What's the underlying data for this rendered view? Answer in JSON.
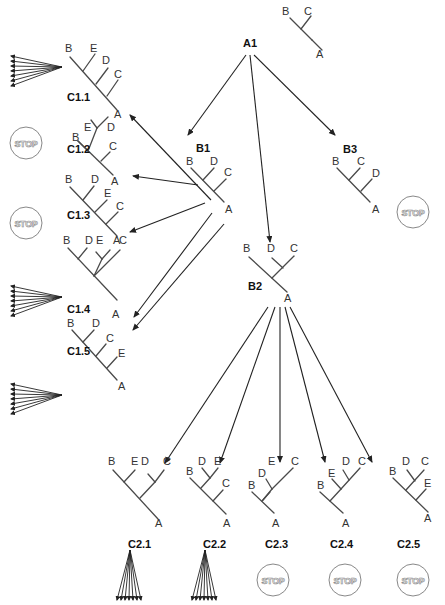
{
  "diagram": {
    "stop_label": "STOP",
    "colors": {
      "edge": "#4a4a4a",
      "arrow": "#222222",
      "stop_circle": "#888888",
      "text": "#333333"
    },
    "trees": [
      {
        "id": "A0",
        "name": "",
        "name_pos": [
          0,
          0
        ],
        "edges": [
          [
            290,
            18,
            312,
            40
          ],
          [
            301,
            29,
            311,
            16
          ],
          [
            312,
            40,
            322,
            50
          ]
        ],
        "leaves": [
          {
            "t": "B",
            "x": 282,
            "y": 15
          },
          {
            "t": "C",
            "x": 304,
            "y": 15
          },
          {
            "t": "A",
            "x": 316,
            "y": 58
          }
        ]
      },
      {
        "id": "A1",
        "name": "A1",
        "name_pos": [
          243,
          47
        ],
        "edges": [],
        "leaves": []
      },
      {
        "id": "C1.1",
        "name": "C1.1",
        "name_pos": [
          67,
          101
        ],
        "edges": [
          [
            70,
            57,
            117,
            110
          ],
          [
            83,
            71,
            95,
            54
          ],
          [
            96,
            84,
            108,
            68
          ],
          [
            107,
            96,
            118,
            80
          ]
        ],
        "leaves": [
          {
            "t": "B",
            "x": 65,
            "y": 52
          },
          {
            "t": "E",
            "x": 90,
            "y": 52
          },
          {
            "t": "D",
            "x": 102,
            "y": 64
          },
          {
            "t": "C",
            "x": 114,
            "y": 78
          },
          {
            "t": "A",
            "x": 114,
            "y": 118
          }
        ]
      },
      {
        "id": "C1.2",
        "name": "C1.2",
        "name_pos": [
          67,
          153
        ],
        "edges": [
          [
            78,
            141,
            113,
            175
          ],
          [
            97,
            128,
            91,
            120
          ],
          [
            97,
            128,
            108,
            117
          ],
          [
            88,
            151,
            97,
            128
          ],
          [
            101,
            161,
            110,
            152
          ],
          [
            78,
            141,
            88,
            151
          ]
        ],
        "leaves": [
          {
            "t": "B",
            "x": 72,
            "y": 141
          },
          {
            "t": "E",
            "x": 84,
            "y": 131
          },
          {
            "t": "D",
            "x": 107,
            "y": 131
          },
          {
            "t": "C",
            "x": 109,
            "y": 150
          },
          {
            "t": "A",
            "x": 111,
            "y": 185
          }
        ]
      },
      {
        "id": "C1.3",
        "name": "C1.3",
        "name_pos": [
          67,
          219
        ],
        "edges": [
          [
            70,
            187,
            117,
            236
          ],
          [
            83,
            200,
            94,
            186
          ],
          [
            95,
            212,
            107,
            200
          ],
          [
            106,
            224,
            118,
            212
          ]
        ],
        "leaves": [
          {
            "t": "B",
            "x": 65,
            "y": 183
          },
          {
            "t": "D",
            "x": 91,
            "y": 183
          },
          {
            "t": "E",
            "x": 104,
            "y": 197
          },
          {
            "t": "C",
            "x": 116,
            "y": 210
          },
          {
            "t": "A",
            "x": 113,
            "y": 244
          }
        ]
      },
      {
        "id": "C1.4",
        "name": "C1.4",
        "name_pos": [
          67,
          313
        ],
        "edges": [
          [
            68,
            248,
            117,
            300
          ],
          [
            78,
            259,
            87,
            248
          ],
          [
            94,
            276,
            102,
            259
          ],
          [
            102,
            259,
            96,
            252
          ],
          [
            102,
            259,
            110,
            250
          ],
          [
            94,
            276,
            120,
            250
          ]
        ],
        "leaves": [
          {
            "t": "B",
            "x": 63,
            "y": 244
          },
          {
            "t": "D",
            "x": 85,
            "y": 244
          },
          {
            "t": "E",
            "x": 96,
            "y": 244
          },
          {
            "t": "C",
            "x": 119,
            "y": 244
          },
          {
            "t": "A",
            "x": 112,
            "y": 318
          }
        ]
      },
      {
        "id": "C1.5",
        "name": "C1.5",
        "name_pos": [
          67,
          355
        ],
        "edges": [
          [
            72,
            330,
            117,
            380
          ],
          [
            83,
            342,
            94,
            330
          ],
          [
            96,
            356,
            106,
            344
          ],
          [
            107,
            368,
            117,
            357
          ]
        ],
        "leaves": [
          {
            "t": "B",
            "x": 67,
            "y": 327
          },
          {
            "t": "D",
            "x": 92,
            "y": 327
          },
          {
            "t": "C",
            "x": 106,
            "y": 342
          },
          {
            "t": "E",
            "x": 118,
            "y": 357
          },
          {
            "t": "A",
            "x": 118,
            "y": 390
          }
        ]
      },
      {
        "id": "B1",
        "name": "B1",
        "name_pos": [
          196,
          152
        ],
        "edges": [
          [
            191,
            168,
            224,
            202
          ],
          [
            203,
            180,
            214,
            168
          ],
          [
            214,
            191,
            226,
            179
          ]
        ],
        "leaves": [
          {
            "t": "B",
            "x": 186,
            "y": 165
          },
          {
            "t": "D",
            "x": 210,
            "y": 165
          },
          {
            "t": "C",
            "x": 224,
            "y": 176
          },
          {
            "t": "A",
            "x": 225,
            "y": 213
          }
        ]
      },
      {
        "id": "B3",
        "name": "B3",
        "name_pos": [
          343,
          153
        ],
        "edges": [
          [
            337,
            168,
            370,
            202
          ],
          [
            349,
            180,
            360,
            168
          ],
          [
            361,
            191,
            372,
            179
          ]
        ],
        "leaves": [
          {
            "t": "B",
            "x": 332,
            "y": 165
          },
          {
            "t": "C",
            "x": 357,
            "y": 165
          },
          {
            "t": "D",
            "x": 372,
            "y": 177
          },
          {
            "t": "A",
            "x": 372,
            "y": 213
          }
        ]
      },
      {
        "id": "B2",
        "name": "B2",
        "name_pos": [
          248,
          290
        ],
        "edges": [
          [
            249,
            257,
            287,
            292
          ],
          [
            272,
            278,
            294,
            256
          ],
          [
            283,
            268,
            272,
            258
          ]
        ],
        "leaves": [
          {
            "t": "B",
            "x": 243,
            "y": 252
          },
          {
            "t": "D",
            "x": 267,
            "y": 252
          },
          {
            "t": "C",
            "x": 290,
            "y": 252
          },
          {
            "t": "A",
            "x": 284,
            "y": 302
          }
        ]
      },
      {
        "id": "C2.1",
        "name": "C2.1",
        "name_pos": [
          128,
          548
        ],
        "edges": [
          [
            113,
            470,
            158,
            519
          ],
          [
            124,
            482,
            135,
            470
          ],
          [
            140,
            498,
            155,
            482
          ],
          [
            155,
            482,
            148,
            474
          ],
          [
            155,
            482,
            164,
            470
          ]
        ],
        "leaves": [
          {
            "t": "B",
            "x": 108,
            "y": 465
          },
          {
            "t": "E",
            "x": 131,
            "y": 465
          },
          {
            "t": "D",
            "x": 141,
            "y": 465
          },
          {
            "t": "C",
            "x": 163,
            "y": 465
          },
          {
            "t": "A",
            "x": 155,
            "y": 527
          }
        ]
      },
      {
        "id": "C2.2",
        "name": "C2.2",
        "name_pos": [
          203,
          548
        ],
        "edges": [
          [
            190,
            478,
            226,
            514
          ],
          [
            201,
            488,
            210,
            478
          ],
          [
            210,
            478,
            202,
            468
          ],
          [
            210,
            478,
            218,
            468
          ],
          [
            213,
            501,
            223,
            490
          ]
        ],
        "leaves": [
          {
            "t": "B",
            "x": 186,
            "y": 475
          },
          {
            "t": "D",
            "x": 198,
            "y": 465
          },
          {
            "t": "E",
            "x": 214,
            "y": 465
          },
          {
            "t": "C",
            "x": 222,
            "y": 487
          },
          {
            "t": "A",
            "x": 223,
            "y": 527
          }
        ]
      },
      {
        "id": "C2.3",
        "name": "C2.3",
        "name_pos": [
          265,
          548
        ],
        "edges": [
          [
            252,
            492,
            274,
            513
          ],
          [
            262,
            501,
            270,
            492
          ],
          [
            272,
            489,
            266,
            479
          ],
          [
            272,
            489,
            293,
            468
          ],
          [
            263,
            500,
            272,
            489
          ]
        ],
        "leaves": [
          {
            "t": "B",
            "x": 248,
            "y": 489
          },
          {
            "t": "D",
            "x": 258,
            "y": 477
          },
          {
            "t": "E",
            "x": 268,
            "y": 465
          },
          {
            "t": "C",
            "x": 291,
            "y": 465
          },
          {
            "t": "A",
            "x": 272,
            "y": 527
          }
        ]
      },
      {
        "id": "C2.4",
        "name": "C2.4",
        "name_pos": [
          330,
          548
        ],
        "edges": [
          [
            320,
            492,
            343,
            513
          ],
          [
            330,
            501,
            341,
            489
          ],
          [
            341,
            489,
            332,
            479
          ],
          [
            341,
            489,
            360,
            468
          ],
          [
            349,
            480,
            343,
            470
          ]
        ],
        "leaves": [
          {
            "t": "B",
            "x": 317,
            "y": 489
          },
          {
            "t": "E",
            "x": 328,
            "y": 477
          },
          {
            "t": "D",
            "x": 342,
            "y": 465
          },
          {
            "t": "C",
            "x": 358,
            "y": 465
          },
          {
            "t": "A",
            "x": 342,
            "y": 527
          }
        ]
      },
      {
        "id": "C2.5",
        "name": "C2.5",
        "name_pos": [
          397,
          548
        ],
        "edges": [
          [
            393,
            478,
            428,
            512
          ],
          [
            406,
            490,
            424,
            470
          ],
          [
            415,
            481,
            407,
            470
          ],
          [
            416,
            500,
            426,
            489
          ]
        ],
        "leaves": [
          {
            "t": "B",
            "x": 389,
            "y": 475
          },
          {
            "t": "D",
            "x": 402,
            "y": 465
          },
          {
            "t": "C",
            "x": 421,
            "y": 465
          },
          {
            "t": "E",
            "x": 424,
            "y": 487
          },
          {
            "t": "A",
            "x": 424,
            "y": 522
          }
        ]
      }
    ],
    "arrows": [
      [
        246,
        55,
        188,
        135
      ],
      [
        250,
        55,
        270,
        242
      ],
      [
        254,
        55,
        335,
        135
      ],
      [
        211,
        200,
        130,
        115
      ],
      [
        198,
        185,
        133,
        176
      ],
      [
        205,
        203,
        130,
        232
      ],
      [
        212,
        213,
        134,
        317
      ],
      [
        224,
        224,
        133,
        330
      ],
      [
        268,
        307,
        165,
        463
      ],
      [
        275,
        307,
        220,
        463
      ],
      [
        280,
        307,
        280,
        462
      ],
      [
        285,
        307,
        325,
        462
      ],
      [
        290,
        307,
        372,
        462
      ]
    ],
    "fans_left": [
      {
        "origin": [
          62,
          67
        ],
        "targets": [
          [
            11,
            56
          ],
          [
            11,
            61
          ],
          [
            11,
            66
          ],
          [
            11,
            71
          ],
          [
            11,
            76
          ],
          [
            11,
            81
          ],
          [
            11,
            86
          ]
        ]
      },
      {
        "origin": [
          62,
          297
        ],
        "targets": [
          [
            11,
            286
          ],
          [
            11,
            291
          ],
          [
            11,
            296
          ],
          [
            11,
            301
          ],
          [
            11,
            306
          ],
          [
            11,
            311
          ],
          [
            11,
            316
          ]
        ]
      },
      {
        "origin": [
          62,
          395
        ],
        "targets": [
          [
            11,
            384
          ],
          [
            11,
            389
          ],
          [
            11,
            394
          ],
          [
            11,
            399
          ],
          [
            11,
            404
          ],
          [
            11,
            409
          ],
          [
            11,
            414
          ]
        ]
      }
    ],
    "fans_down": [
      {
        "origin": [
          130,
          550
        ],
        "targets": [
          [
            117,
            600
          ],
          [
            121,
            600
          ],
          [
            125,
            600
          ],
          [
            129,
            600
          ],
          [
            133,
            600
          ],
          [
            137,
            600
          ],
          [
            141,
            600
          ]
        ]
      },
      {
        "origin": [
          205,
          550
        ],
        "targets": [
          [
            192,
            600
          ],
          [
            196,
            600
          ],
          [
            200,
            600
          ],
          [
            204,
            600
          ],
          [
            208,
            600
          ],
          [
            212,
            600
          ],
          [
            216,
            600
          ]
        ]
      }
    ],
    "stops": [
      {
        "id": "stop-c1-2",
        "cx": 26,
        "cy": 143
      },
      {
        "id": "stop-c1-3",
        "cx": 26,
        "cy": 223
      },
      {
        "id": "stop-b3",
        "cx": 413,
        "cy": 212
      },
      {
        "id": "stop-c2-3",
        "cx": 273,
        "cy": 580
      },
      {
        "id": "stop-c2-4",
        "cx": 345,
        "cy": 580
      },
      {
        "id": "stop-c2-5",
        "cx": 413,
        "cy": 580
      }
    ]
  }
}
